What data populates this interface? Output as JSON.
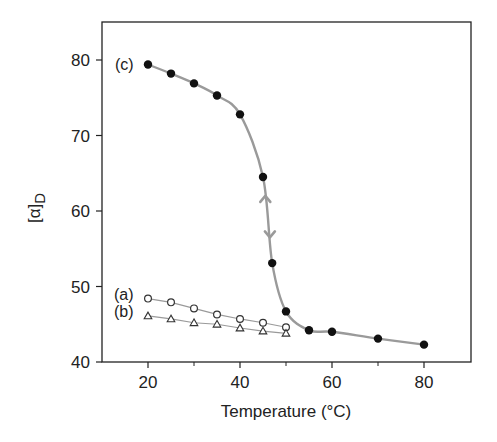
{
  "chart_data": {
    "type": "line",
    "title": "",
    "xlabel": "Temperature (°C)",
    "ylabel": "[α]D",
    "ylabel_main": "[α]",
    "ylabel_sub": "D",
    "xlim": [
      10,
      90
    ],
    "ylim": [
      40,
      85
    ],
    "xticks": [
      20,
      40,
      60,
      80
    ],
    "xticks_minor": [
      30,
      50,
      70
    ],
    "yticks": [
      40,
      50,
      60,
      70,
      80
    ],
    "grid": false,
    "legend": "none (inline labels)",
    "series": [
      {
        "name": "(a)",
        "marker": "open-circle",
        "line": "straight",
        "x": [
          20,
          25,
          30,
          35,
          40,
          45,
          50
        ],
        "y": [
          48.4,
          47.9,
          47.1,
          46.3,
          45.7,
          45.2,
          44.6
        ]
      },
      {
        "name": "(b)",
        "marker": "open-triangle",
        "line": "straight",
        "x": [
          20,
          25,
          30,
          35,
          40,
          45,
          50
        ],
        "y": [
          46.1,
          45.7,
          45.2,
          45.0,
          44.5,
          44.1,
          43.8
        ]
      },
      {
        "name": "(c)",
        "marker": "filled-circle",
        "line": "smooth-sigmoid",
        "x": [
          20,
          25,
          30,
          35,
          40,
          45,
          47,
          50,
          55,
          60,
          70,
          80
        ],
        "y": [
          79.4,
          78.2,
          76.9,
          75.3,
          72.8,
          64.5,
          53.1,
          46.7,
          44.2,
          44.0,
          43.1,
          42.3
        ]
      }
    ],
    "annotations": [
      {
        "type": "arrow-up",
        "x": 45.5,
        "y": 62.0,
        "desc": "heating/cooling reversibility arrow up"
      },
      {
        "type": "arrow-down",
        "x": 46.5,
        "y": 56.5,
        "desc": "heating/cooling reversibility arrow down"
      }
    ]
  },
  "colors": {
    "axis": "#222222",
    "curve": "#9a9a9a",
    "marker_fill": "#111111",
    "marker_open_stroke": "#333333"
  }
}
